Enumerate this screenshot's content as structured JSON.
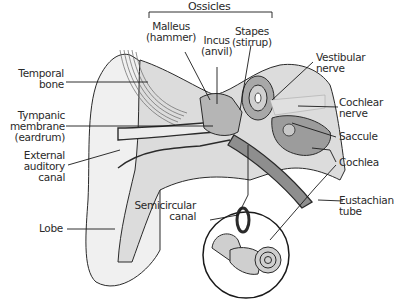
{
  "diagram": {
    "title": "Ossicles",
    "labels": {
      "ossicles": "Ossicles",
      "malleus": [
        "Malleus",
        "(hammer)"
      ],
      "incus": [
        "Incus",
        "(anvil)"
      ],
      "stapes": [
        "Stapes",
        "(stirrup)"
      ],
      "temporal_bone": [
        "Temporal",
        "bone"
      ],
      "tympanic_membrane": [
        "Tympanic",
        "membrane",
        "(eardrum)"
      ],
      "external_auditory_canal": [
        "External",
        "auditory",
        "canal"
      ],
      "lobe": "Lobe",
      "vestibular_nerve": [
        "Vestibular",
        "nerve"
      ],
      "cochlear_nerve": [
        "Cochlear",
        "nerve"
      ],
      "saccule": "Saccule",
      "cochlea": "Cochlea",
      "eustachian_tube": [
        "Eustachian",
        "tube"
      ],
      "semicircular_canal": [
        "Semicircular",
        "canal"
      ]
    },
    "colors": {
      "outline": "#2a2a2a",
      "bone_fill": "#d9d9d9",
      "tissue_fill": "#e8e8e8",
      "dark_fill": "#9a9a9a",
      "skin": "#f0f0f0"
    }
  }
}
